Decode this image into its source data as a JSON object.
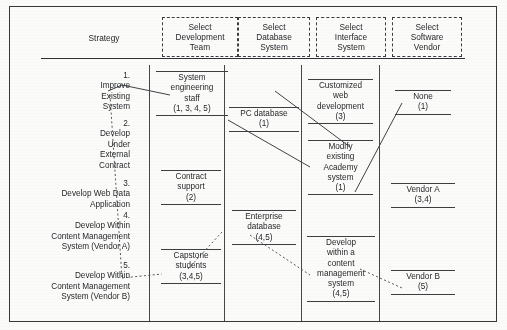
{
  "diagram": {
    "title_column_label": "Strategy",
    "headers": [
      {
        "id": "development-team",
        "label": "Select\nDevelopment\nTeam"
      },
      {
        "id": "database-system",
        "label": "Select\nDatabase\nSystem"
      },
      {
        "id": "interface-system",
        "label": "Select\nInterface\nSystem"
      },
      {
        "id": "software-vendor",
        "label": "Select\nSoftware\nVendor"
      }
    ],
    "strategies": [
      {
        "number": "1.",
        "label": "1.\nImprove\nExisting\nSystem"
      },
      {
        "number": "2.",
        "label": "2.\nDevelop\nUnder\nExternal\nContract"
      },
      {
        "number": "3.",
        "label": "3.\nDevelop Web Data\nApplication"
      },
      {
        "number": "4.",
        "label": "4.\nDevelop Within\nContent Management\nSystem (Vendor A)"
      },
      {
        "number": "5.",
        "label": "5.\nDevelop Within\nContent Management\nSystem (Vendor B)"
      }
    ],
    "columns": [
      {
        "id": "development-team",
        "options": [
          {
            "id": "system-engineering-staff",
            "label": "System\nengineering\nstaff\n(1, 3, 4, 5)",
            "strategies": "(1, 3, 4, 5)"
          },
          {
            "id": "contract-support",
            "label": "Contract\nsupport\n(2)",
            "strategies": "(2)"
          },
          {
            "id": "capstone-students",
            "label": "Capstone\nstudents\n(3,4,5)",
            "strategies": "(3,4,5)"
          }
        ]
      },
      {
        "id": "database-system",
        "options": [
          {
            "id": "pc-database",
            "label": "PC database\n(1)",
            "strategies": "(1)"
          },
          {
            "id": "enterprise-database",
            "label": "Enterprise\ndatabase\n(4,5)",
            "strategies": "(4,5)"
          }
        ]
      },
      {
        "id": "interface-system",
        "options": [
          {
            "id": "customized-web-development",
            "label": "Customized\nweb\ndevelopment\n(3)",
            "strategies": "(3)"
          },
          {
            "id": "modify-existing-academy-system",
            "label": "Modify\nexisting\nAcademy\nsystem\n(1)",
            "strategies": "(1)"
          },
          {
            "id": "develop-within-cms",
            "label": "Develop\nwithin a\ncontent\nmanagement\nsystem\n(4,5)",
            "strategies": "(4,5)"
          }
        ]
      },
      {
        "id": "software-vendor",
        "options": [
          {
            "id": "none",
            "label": "None\n(1)",
            "strategies": "(1)"
          },
          {
            "id": "vendor-a",
            "label": "Vendor A\n(3,4)",
            "strategies": "(3,4)"
          },
          {
            "id": "vendor-b",
            "label": "Vendor B\n(5)",
            "strategies": "(5)"
          }
        ]
      }
    ],
    "colors": {
      "ink": "#25282a",
      "rule": "#3c3f41",
      "frame": "#35383a",
      "background": "#fbfbfa"
    }
  }
}
